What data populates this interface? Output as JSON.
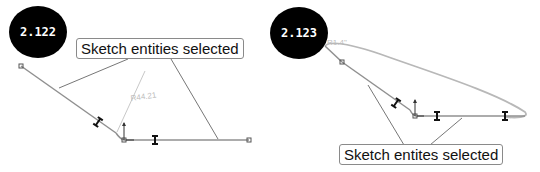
{
  "figures": [
    {
      "label": "2.122",
      "callout": "Sketch entities selected",
      "dimension": "R44.21"
    },
    {
      "label": "2.123",
      "callout": "Sketch entites selected",
      "dimension": "R1.4\""
    }
  ]
}
